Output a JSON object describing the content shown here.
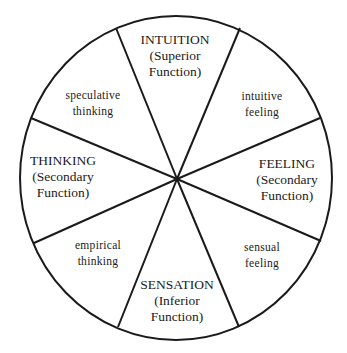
{
  "diagram": {
    "segments": [
      {
        "id": "intuition",
        "lines": [
          "INTUITION",
          "(Superior",
          "Function)"
        ],
        "type": "major"
      },
      {
        "id": "intuitive-feeling",
        "lines": [
          "intuitive",
          "feeling"
        ],
        "type": "minor"
      },
      {
        "id": "feeling",
        "lines": [
          "FEELING",
          "(Secondary",
          "Function)"
        ],
        "type": "major"
      },
      {
        "id": "sensual-feeling",
        "lines": [
          "sensual",
          "feeling"
        ],
        "type": "minor"
      },
      {
        "id": "sensation",
        "lines": [
          "SENSATION",
          "(Inferior",
          "Function)"
        ],
        "type": "major"
      },
      {
        "id": "empirical-thinking",
        "lines": [
          "empirical",
          "thinking"
        ],
        "type": "minor"
      },
      {
        "id": "thinking",
        "lines": [
          "THINKING",
          "(Secondary",
          "Function)"
        ],
        "type": "major"
      },
      {
        "id": "speculative-thinking",
        "lines": [
          "speculative",
          "thinking"
        ],
        "type": "minor"
      }
    ],
    "colors": {
      "stroke": "#1a1a1a",
      "background": "#ffffff"
    }
  }
}
